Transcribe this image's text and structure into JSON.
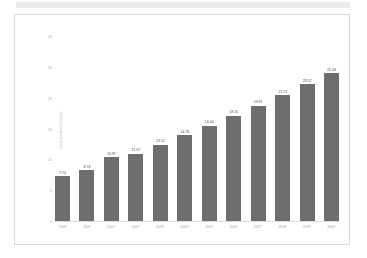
{
  "chart_data": {
    "type": "bar",
    "title": "",
    "subtitle": "",
    "xlabel": "",
    "ylabel": "Investment Amount in Billions",
    "categories": [
      "2019",
      "2020",
      "2021*",
      "2022*",
      "2023*",
      "2024*",
      "2025*",
      "2026*",
      "2027*",
      "2028*",
      "2029*",
      "2030*"
    ],
    "values": [
      7.74,
      8.74,
      10.97,
      11.57,
      13.15,
      14.76,
      16.44,
      18.15,
      19.91,
      21.72,
      23.57,
      25.44
    ],
    "value_labels": [
      "7.74",
      "8.74",
      "10.97",
      "11.57",
      "13.15",
      "14.76",
      "16.44",
      "18.15",
      "19.91",
      "21.72",
      "23.57",
      "25.44"
    ],
    "ylim": [
      0,
      30
    ],
    "yticks": [
      0,
      5,
      10,
      15,
      20,
      25,
      30
    ],
    "ytick_labels": [
      "0",
      "5",
      "10",
      "15",
      "20",
      "25",
      "30"
    ],
    "grid": false,
    "legend": "none",
    "series": [
      {
        "name": "Investment Amount",
        "values": [
          7.74,
          8.74,
          10.97,
          11.57,
          13.15,
          14.76,
          16.44,
          18.15,
          19.91,
          21.72,
          23.57,
          25.44
        ]
      }
    ],
    "colors": {
      "bar": "#6e6e6e",
      "background": "#ffffff",
      "frame": "#d9d9d9",
      "axis_text": "#a0a0a0",
      "value_text": "#4a4a4a",
      "top_band": "#ececec"
    }
  }
}
